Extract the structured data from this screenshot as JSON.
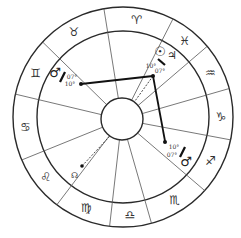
{
  "chart": {
    "signs": [
      {
        "name": "Aries",
        "glyph": "♈"
      },
      {
        "name": "Pisces",
        "glyph": "♓"
      },
      {
        "name": "Aquarius",
        "glyph": "♒"
      },
      {
        "name": "Capricorn",
        "glyph": "♑"
      },
      {
        "name": "Sagittarius",
        "glyph": "♐"
      },
      {
        "name": "Scorpio",
        "glyph": "♏"
      },
      {
        "name": "Libra",
        "glyph": "♎"
      },
      {
        "name": "Virgo",
        "glyph": "♍"
      },
      {
        "name": "Leo",
        "glyph": "♌"
      },
      {
        "name": "Cancer",
        "glyph": "♋"
      },
      {
        "name": "Gemini",
        "glyph": "♊"
      },
      {
        "name": "Taurus",
        "glyph": "♉"
      }
    ],
    "planets": {
      "mars_left": {
        "glyph": "♂",
        "deg_a": "07°",
        "deg_b": "10°"
      },
      "sun_jupiter": {
        "glyph_a": "☉",
        "glyph_b": "♃",
        "deg_a": "10°",
        "deg_b": "07°"
      },
      "mars_right": {
        "glyph": "♂",
        "deg_a": "10°",
        "deg_b": "07°"
      },
      "node": {
        "glyph": "☊"
      }
    }
  }
}
